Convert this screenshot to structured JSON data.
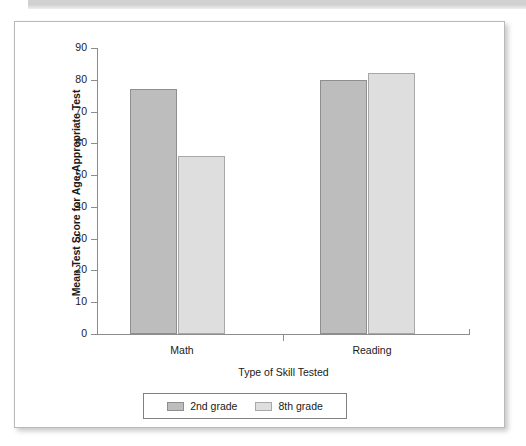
{
  "page": {
    "background_color": "#ffffff",
    "card_background": "#ffffff",
    "banner_color": "#d2d2d2"
  },
  "chart_data": {
    "type": "bar",
    "title": "",
    "subtitle": "",
    "categories": [
      "Math",
      "Reading"
    ],
    "series": [
      {
        "name": "2nd grade",
        "values": [
          77,
          80
        ],
        "color": "#bdbdbd"
      },
      {
        "name": "8th grade",
        "values": [
          56,
          82
        ],
        "color": "#dedede"
      }
    ],
    "xlabel": "Type of Skill Tested",
    "ylabel": "Mean Test Score for Age-Appropriate Test",
    "ylim": [
      0,
      90
    ],
    "yticks": [
      0,
      10,
      20,
      30,
      40,
      50,
      60,
      70,
      80,
      90
    ],
    "ytick_labels": [
      "0",
      "10",
      "20",
      "30",
      "40",
      "50",
      "60",
      "70",
      "80",
      "90"
    ],
    "grid": false,
    "legend_position": "bottom-center",
    "legend_entries": [
      "2nd grade",
      "8th grade"
    ],
    "annotations": []
  }
}
